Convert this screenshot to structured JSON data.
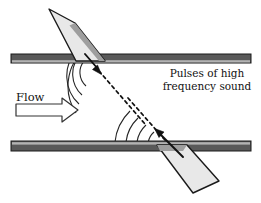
{
  "figure": {
    "width": 261,
    "height": 203,
    "background_color": "#ffffff"
  },
  "labels": {
    "flow": "Flow",
    "pulses_line1": "Pulses of high",
    "pulses_line2": "frequency sound"
  },
  "colors": {
    "background": "#ffffff",
    "pipe_wall_fill": "#595959",
    "pipe_wall_highlight": "#b0b0b0",
    "pipe_wall_stroke": "#1a1a1a",
    "transducer_fill": "#e8e8e8",
    "transducer_shade": "#9a9a9a",
    "transducer_stroke": "#1a1a1a",
    "wave_arc_stroke": "#262626",
    "beam_dash_stroke": "#111111",
    "arrow_stroke": "#111111",
    "flow_arrow_fill": "#ffffff",
    "text": "#111111"
  },
  "pipe": {
    "upper_wall": {
      "x": 11,
      "y": 54,
      "width": 240,
      "height": 9
    },
    "lower_wall": {
      "x": 11,
      "y": 141,
      "width": 240,
      "height": 10
    }
  },
  "transducers": [
    {
      "name": "upper-transducer",
      "position": "top-left",
      "emits": "transmit-pulse",
      "points": "49,9 74,23 104,60 75,60"
    },
    {
      "name": "lower-transducer",
      "position": "bottom-right",
      "emits": "receive-pulse",
      "points": "157,144 186,144 218,180 192,192"
    }
  ],
  "beams": [
    {
      "name": "downstream-beam",
      "from": [
        99,
        71
      ],
      "to": [
        143,
        122
      ],
      "style": "dashed"
    },
    {
      "name": "upstream-beam",
      "from": [
        127,
        97
      ],
      "to": [
        172,
        148
      ],
      "style": "dashed"
    }
  ],
  "direction_arrows": [
    {
      "name": "transmit-arrow",
      "from": [
        86,
        55
      ],
      "to": [
        101,
        73
      ],
      "direction": "down-right"
    },
    {
      "name": "receive-arrow",
      "from": [
        182,
        156
      ],
      "to": [
        154,
        128
      ],
      "direction": "up-left"
    }
  ],
  "wavefronts": {
    "upper_source": [
      100,
      72
    ],
    "lower_source": [
      168,
      146
    ],
    "upper_radii": [
      16,
      27,
      38,
      49
    ],
    "lower_radii": [
      16,
      27,
      38,
      49
    ]
  },
  "flow_arrow": {
    "name": "flow-direction-arrow",
    "points": "16,105 63,105 63,100 77,110 63,120 63,115 16,115",
    "direction": "right"
  },
  "text_positions": {
    "flow": {
      "x": 16,
      "y": 100
    },
    "pulses_line1": {
      "x": 207,
      "y": 77
    },
    "pulses_line2": {
      "x": 207,
      "y": 90
    }
  }
}
